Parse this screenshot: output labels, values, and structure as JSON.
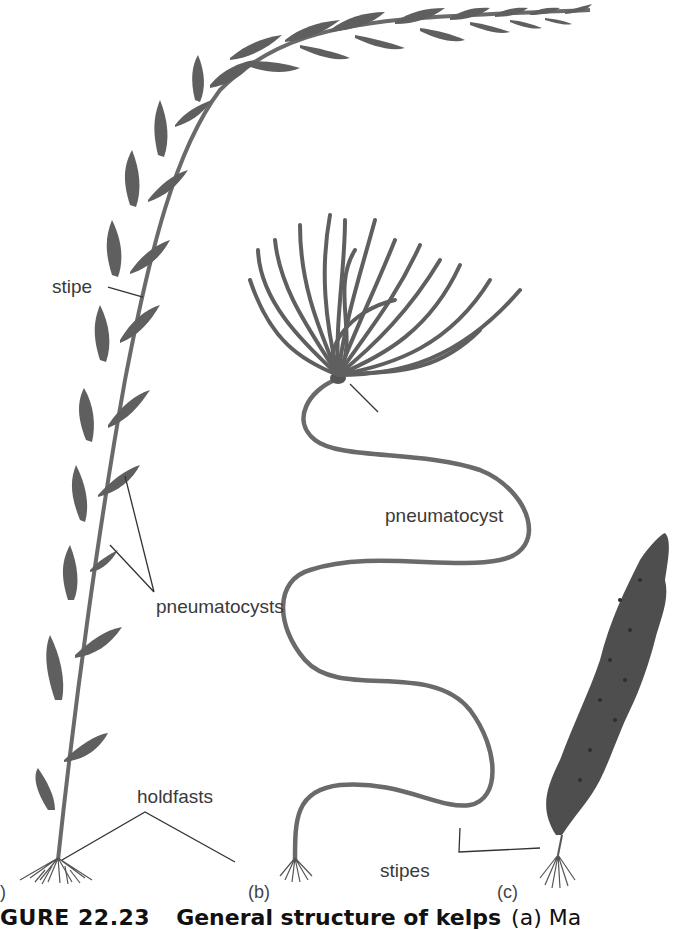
{
  "figure": {
    "labels": {
      "stipe": "stipe",
      "pneumatocysts": "pneumatocysts",
      "pneumatocyst": "pneumatocyst",
      "holdfasts": "holdfasts",
      "stipes": "stipes"
    },
    "panels": {
      "a": ")",
      "b": "(b)",
      "c": "(c)"
    },
    "caption": {
      "number": "GURE 22.23",
      "title": "General structure of kelps",
      "rest": "(a) Ma"
    },
    "colors": {
      "kelp": "#5f5f5f",
      "blade": "#555555",
      "line": "#333333",
      "text": "#3a3a3a"
    }
  }
}
